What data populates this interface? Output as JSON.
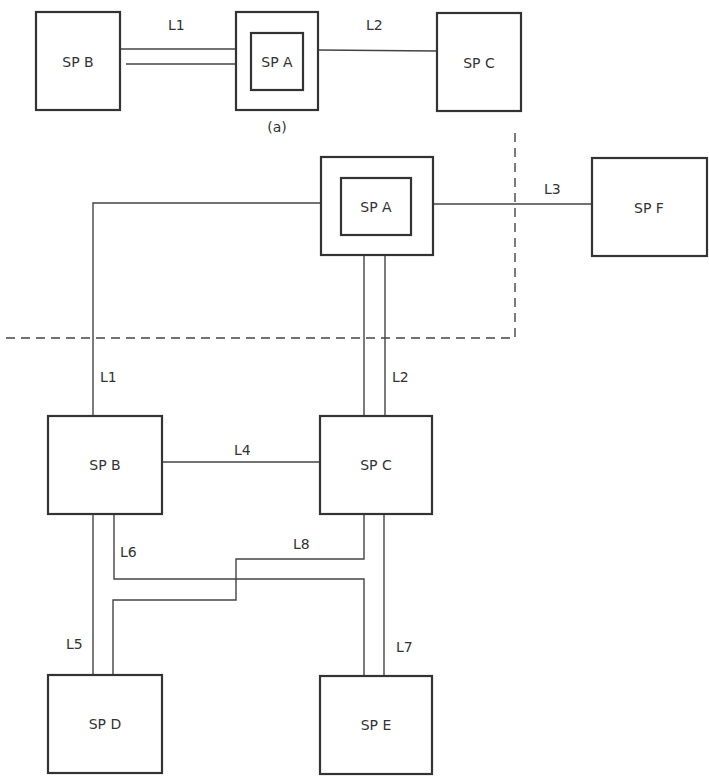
{
  "diagram_a": {
    "caption": "(a)",
    "nodes": [
      {
        "id": "B",
        "label": "SP B",
        "x": 36,
        "y": 12,
        "w": 84,
        "h": 98,
        "nested": false
      },
      {
        "id": "A",
        "label": "SP A",
        "x": 236,
        "y": 12,
        "w": 82,
        "h": 98,
        "nested": true,
        "inner": {
          "x": 251,
          "y": 33,
          "w": 52,
          "h": 57
        }
      },
      {
        "id": "C",
        "label": "SP C",
        "x": 437,
        "y": 13,
        "w": 84,
        "h": 98,
        "nested": false
      }
    ],
    "links": [
      {
        "label": "L1",
        "lx": 168,
        "ly": 30
      },
      {
        "label": "L2",
        "lx": 366,
        "ly": 30
      }
    ]
  },
  "diagram_b": {
    "nodes": [
      {
        "id": "A",
        "label": "SP A",
        "x": 321,
        "y": 157,
        "w": 112,
        "h": 98,
        "nested": true,
        "inner": {
          "x": 341,
          "y": 178,
          "w": 70,
          "h": 57
        }
      },
      {
        "id": "F",
        "label": "SP F",
        "x": 592,
        "y": 158,
        "w": 115,
        "h": 98,
        "nested": false
      },
      {
        "id": "B",
        "label": "SP B",
        "x": 48,
        "y": 416,
        "w": 114,
        "h": 98,
        "nested": false
      },
      {
        "id": "C",
        "label": "SP C",
        "x": 320,
        "y": 416,
        "w": 112,
        "h": 98,
        "nested": false
      },
      {
        "id": "D",
        "label": "SP D",
        "x": 48,
        "y": 675,
        "w": 114,
        "h": 98,
        "nested": false
      },
      {
        "id": "E",
        "label": "SP E",
        "x": 320,
        "y": 676,
        "w": 112,
        "h": 98,
        "nested": false
      }
    ],
    "links": [
      {
        "label": "L1",
        "lx": 100,
        "ly": 382
      },
      {
        "label": "L2",
        "lx": 392,
        "ly": 382
      },
      {
        "label": "L3",
        "lx": 544,
        "ly": 247
      },
      {
        "label": "L4",
        "lx": 234,
        "ly": 455
      },
      {
        "label": "L5",
        "lx": 66,
        "ly": 649
      },
      {
        "label": "L6",
        "lx": 120,
        "ly": 557
      },
      {
        "label": "L7",
        "lx": 396,
        "ly": 652
      },
      {
        "label": "L8",
        "lx": 293,
        "ly": 549
      }
    ]
  }
}
